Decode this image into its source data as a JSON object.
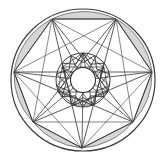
{
  "figure": {
    "type": "geometric-diagram",
    "background_color": "#ffffff",
    "canvas": {
      "width": 167,
      "height": 160
    }
  },
  "chart_data": {
    "type": "scatter",
    "xlabel": "",
    "ylabel": "",
    "grid": false,
    "legend": "none",
    "xlim": [
      0,
      167
    ],
    "ylim": [
      0,
      160
    ],
    "center": {
      "x": 83,
      "y": 80
    },
    "outer_circle": {
      "cx": 83,
      "cy": 80,
      "rx": 72,
      "ry": 71
    },
    "hub_circle": {
      "cx": 83,
      "cy": 80,
      "r": 27
    },
    "core_circle": {
      "cx": 83,
      "cy": 80,
      "r": 12.5
    },
    "vertex_count": 7,
    "star_step": 3,
    "outer_vertices": [
      {
        "label": "V1",
        "x": 83,
        "y": 9
      },
      {
        "label": "V2",
        "x": 138,
        "y": 36
      },
      {
        "label": "V3",
        "x": 152,
        "y": 95
      },
      {
        "label": "V4",
        "x": 115,
        "y": 142
      },
      {
        "label": "V5",
        "x": 51,
        "y": 142
      },
      {
        "label": "V6",
        "x": 14,
        "y": 95
      },
      {
        "label": "V7",
        "x": 28,
        "y": 36
      }
    ],
    "polygon_vertices": [
      {
        "label": "P1",
        "x": 52,
        "y": 19
      },
      {
        "label": "P2",
        "x": 116,
        "y": 19
      },
      {
        "label": "P3",
        "x": 152,
        "y": 72
      },
      {
        "label": "P4",
        "x": 133,
        "y": 122
      },
      {
        "label": "P5",
        "x": 82,
        "y": 148
      },
      {
        "label": "P6",
        "x": 33,
        "y": 122
      },
      {
        "label": "P7",
        "x": 14,
        "y": 72
      }
    ],
    "hub_vertices": [
      {
        "label": "H1",
        "x": 83,
        "y": 53
      },
      {
        "label": "H2",
        "x": 104,
        "y": 67
      },
      {
        "label": "H3",
        "x": 108,
        "y": 92
      },
      {
        "label": "H4",
        "x": 92,
        "y": 105
      },
      {
        "label": "H5",
        "x": 74,
        "y": 105
      },
      {
        "label": "H6",
        "x": 58,
        "y": 92
      },
      {
        "label": "H7",
        "x": 62,
        "y": 67
      }
    ]
  },
  "style": {
    "stroke_color": "#3a3a3a",
    "stroke_color_light": "#555555",
    "shade_fill": "#d6d6d6",
    "core_fill": "#ffffff",
    "stroke_width": "1",
    "stroke_width_thin": "0.7"
  },
  "elements": {
    "outer_circle_name": "outer-rim-circle",
    "heptagon_name": "inscribed-heptagon",
    "segment_name": "shaded-rim-segment",
    "spoke_name": "radial-spoke",
    "chord_name": "star-chord",
    "hub_name": "hub-circle",
    "core_name": "center-core-circle",
    "inner_star_name": "inner-heptagram"
  }
}
